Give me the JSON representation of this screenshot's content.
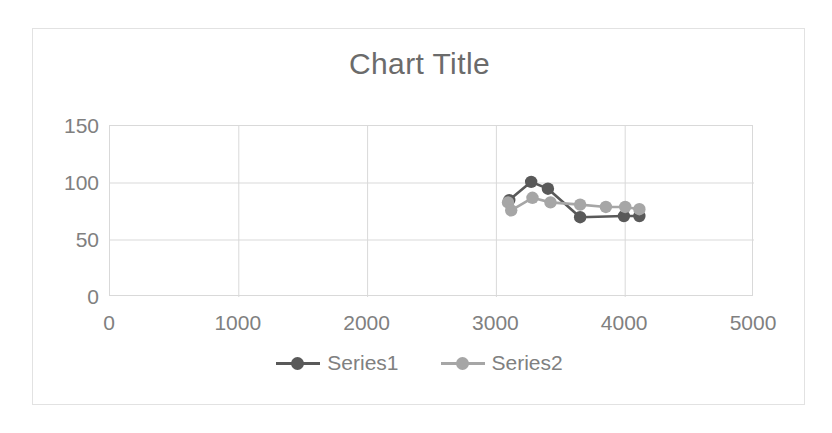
{
  "chart": {
    "title": "Chart Title",
    "background_color": "#ffffff",
    "border_color": "#e2e2e2",
    "gridline_color": "#d9d9d9",
    "text_color": "#808080",
    "title_color": "#6b6b6b"
  },
  "legend": {
    "position": "bottom",
    "entries": [
      {
        "label": "Series1",
        "color": "#595959"
      },
      {
        "label": "Series2",
        "color": "#a6a6a6"
      }
    ]
  },
  "axes": {
    "x": {
      "label": "",
      "min": 0,
      "max": 5000,
      "ticks": [
        0,
        1000,
        2000,
        3000,
        4000,
        5000
      ],
      "tick_labels": [
        "0",
        "1000",
        "2000",
        "3000",
        "4000",
        "5000"
      ]
    },
    "y": {
      "label": "",
      "min": 0,
      "max": 150,
      "ticks": [
        0,
        50,
        100,
        150
      ],
      "tick_labels": [
        "0",
        "50",
        "100",
        "150"
      ]
    }
  },
  "chart_data": {
    "type": "line",
    "title": "Chart Title",
    "xlabel": "",
    "ylabel": "",
    "xlim": [
      0,
      5000
    ],
    "ylim": [
      0,
      150
    ],
    "xticks": [
      0,
      1000,
      2000,
      3000,
      4000,
      5000
    ],
    "yticks": [
      0,
      50,
      100,
      150
    ],
    "grid": true,
    "legend_position": "bottom",
    "markers": "circle",
    "series": [
      {
        "name": "Series1",
        "color": "#595959",
        "points": [
          {
            "x": 3100,
            "y": 85
          },
          {
            "x": 3270,
            "y": 101
          },
          {
            "x": 3400,
            "y": 95
          },
          {
            "x": 3650,
            "y": 70
          },
          {
            "x": 3990,
            "y": 71
          },
          {
            "x": 4110,
            "y": 71
          }
        ]
      },
      {
        "name": "Series2",
        "color": "#a6a6a6",
        "points": [
          {
            "x": 3090,
            "y": 83
          },
          {
            "x": 3115,
            "y": 76
          },
          {
            "x": 3280,
            "y": 87
          },
          {
            "x": 3420,
            "y": 83
          },
          {
            "x": 3650,
            "y": 81
          },
          {
            "x": 3850,
            "y": 79
          },
          {
            "x": 4000,
            "y": 79
          },
          {
            "x": 4110,
            "y": 77
          }
        ]
      }
    ]
  }
}
